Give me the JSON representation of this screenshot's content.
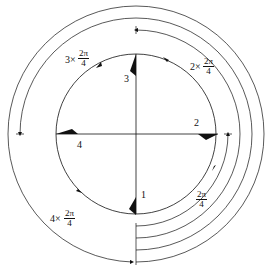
{
  "diagram": {
    "markers": [
      {
        "id": "1",
        "label": "1",
        "position": "bottom"
      },
      {
        "id": "2",
        "label": "2",
        "position": "right"
      },
      {
        "id": "3",
        "label": "3",
        "position": "top"
      },
      {
        "id": "4",
        "label": "4",
        "position": "left"
      }
    ],
    "arcs": [
      {
        "multiplier": "",
        "numerator": "2π",
        "denominator": "4",
        "prefix": ""
      },
      {
        "multiplier": "2",
        "numerator": "2π",
        "denominator": "4",
        "prefix": "2×"
      },
      {
        "multiplier": "3",
        "numerator": "2π",
        "denominator": "4",
        "prefix": "3×"
      },
      {
        "multiplier": "4",
        "numerator": "2π",
        "denominator": "4",
        "prefix": "4×"
      }
    ]
  }
}
